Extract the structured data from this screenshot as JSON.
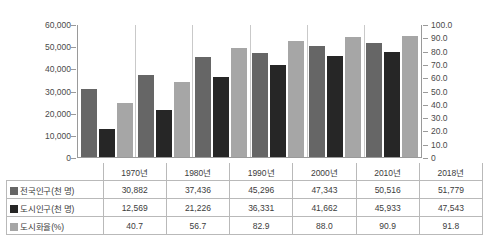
{
  "chart_data": {
    "type": "bar",
    "title": "",
    "subtitle": "",
    "xlabel": "",
    "ylabel": "",
    "grid": false,
    "legend_position": "table-below",
    "categories": [
      "1970년",
      "1980년",
      "1990년",
      "2000년",
      "2010년",
      "2018년"
    ],
    "axes": {
      "left": {
        "label": "",
        "ylim": [
          0,
          60000
        ],
        "ticks": [
          0,
          10000,
          20000,
          30000,
          40000,
          50000,
          60000
        ],
        "tick_labels": [
          "0",
          "10,000",
          "20,000",
          "30,000",
          "40,000",
          "50,000",
          "60,000"
        ]
      },
      "right": {
        "label": "",
        "ylim": [
          0,
          100
        ],
        "ticks": [
          0,
          10,
          20,
          30,
          40,
          50,
          60,
          70,
          80,
          90,
          100
        ],
        "tick_labels": [
          "0",
          "10.0",
          "20.0",
          "30.0",
          "40.0",
          "50.0",
          "60.0",
          "70.0",
          "80.0",
          "90.0",
          "100.0"
        ]
      }
    },
    "series": [
      {
        "name": "전국인구(천 명)",
        "axis": "left",
        "color": "#666666",
        "values": [
          30882,
          37436,
          45296,
          47343,
          50516,
          51779
        ],
        "value_labels": [
          "30,882",
          "37,436",
          "45,296",
          "47,343",
          "50,516",
          "51,779"
        ]
      },
      {
        "name": "도시인구(천 명)",
        "axis": "left",
        "color": "#262626",
        "values": [
          12569,
          21226,
          36331,
          41662,
          45933,
          47543
        ],
        "value_labels": [
          "12,569",
          "21,226",
          "36,331",
          "41,662",
          "45,933",
          "47,543"
        ]
      },
      {
        "name": "도시화율(%)",
        "axis": "right",
        "color": "#a6a6a6",
        "values": [
          40.7,
          56.7,
          82.9,
          88.0,
          90.9,
          91.8
        ],
        "value_labels": [
          "40.7",
          "56.7",
          "82.9",
          "88.0",
          "90.9",
          "91.8"
        ]
      }
    ]
  },
  "table": {
    "corner_label": "",
    "column_headers": [
      "1970년",
      "1980년",
      "1990년",
      "2000년",
      "2010년",
      "2018년"
    ],
    "rows": [
      {
        "label": "전국인구(천 명)",
        "swatch": "#666666",
        "cells": [
          "30,882",
          "37,436",
          "45,296",
          "47,343",
          "50,516",
          "51,779"
        ]
      },
      {
        "label": "도시인구(천 명)",
        "swatch": "#262626",
        "cells": [
          "12,569",
          "21,226",
          "36,331",
          "41,662",
          "45,933",
          "47,543"
        ]
      },
      {
        "label": "도시화율(%)",
        "swatch": "#a6a6a6",
        "cells": [
          "40.7",
          "56.7",
          "82.9",
          "88.0",
          "90.9",
          "91.8"
        ]
      }
    ]
  }
}
